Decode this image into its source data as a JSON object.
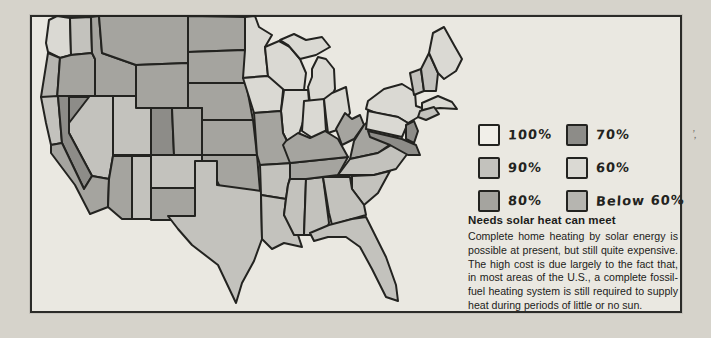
{
  "page": {
    "background": "#d6d3cb",
    "panel_background": "#eae8e1",
    "panel_border": "#2b2b28"
  },
  "legend": {
    "items": [
      {
        "label": "100%",
        "category": "c100",
        "color": "#f1efe9"
      },
      {
        "label": "90%",
        "category": "c90",
        "color": "#c3c2bd"
      },
      {
        "label": "80%",
        "category": "c80",
        "color": "#a5a49f"
      },
      {
        "label": "70%",
        "category": "c70",
        "color": "#8d8c88"
      },
      {
        "label": "60%",
        "category": "c60",
        "color": "#dad9d3"
      },
      {
        "label": "Below 60%",
        "category": "cb60",
        "color": "#b6b5b0"
      }
    ]
  },
  "caption": {
    "title": "Needs solar heat can meet",
    "body": "Complete home heating by solar energy is possible at present, but still quite expensive. The high cost is due largely to the fact that, in most areas of the U.S., a complete fossil-fuel heating system is still required to supply heat during periods of little or no sun."
  },
  "stray_mark": "’,",
  "map": {
    "stroke": "#232320",
    "category_colors": {
      "c100": "#f1efe9",
      "c90": "#c3c2bd",
      "c80": "#a5a49f",
      "c70": "#8d8c88",
      "c60": "#dad9d3",
      "cb60": "#b6b5b0"
    },
    "regions": [
      {
        "id": "washington-west",
        "category": "c60",
        "points": "14,30 17,7 25,3 38,5 39,42 28,45 16,39"
      },
      {
        "id": "washington-east",
        "category": "c90",
        "points": "38,5 59,4 60,40 39,42"
      },
      {
        "id": "oregon-coast",
        "category": "cb60",
        "points": "16,40 28,45 25,86 9,84"
      },
      {
        "id": "oregon-inland",
        "category": "c80",
        "points": "28,45 39,42 60,40 63,46 63,85 25,86"
      },
      {
        "id": "idaho",
        "category": "c80",
        "points": "59,4 67,3 70,40 104,52 104,83 63,83 63,46 60,40"
      },
      {
        "id": "montana",
        "category": "c80",
        "points": "67,3 156,3 156,50 104,52 70,40"
      },
      {
        "id": "wyoming",
        "category": "c80",
        "points": "104,52 156,50 156,95 104,95"
      },
      {
        "id": "north-dakota",
        "category": "c80",
        "points": "156,3 213,4 213,37 156,39"
      },
      {
        "id": "south-dakota",
        "category": "c80",
        "points": "156,39 213,37 214,70 156,70"
      },
      {
        "id": "nebraska",
        "category": "c80",
        "points": "156,70 214,70 221,107 170,107 170,95 156,95"
      },
      {
        "id": "kansas",
        "category": "c80",
        "points": "170,107 221,107 225,142 170,142"
      },
      {
        "id": "utah",
        "category": "c90",
        "points": "81,83 104,83 104,95 119,95 119,142 81,142"
      },
      {
        "id": "colorado-west",
        "category": "c70",
        "points": "119,95 140,95 142,142 119,142"
      },
      {
        "id": "colorado-east",
        "category": "c80",
        "points": "140,95 170,95 170,142 142,142"
      },
      {
        "id": "nevada",
        "category": "c90",
        "points": "37,83 81,83 81,143 77,166 60,163 37,120"
      },
      {
        "id": "nevada-northwest",
        "category": "c70",
        "points": "37,84 57,84 37,110"
      },
      {
        "id": "california-north",
        "category": "c90",
        "points": "9,84 26,83 30,130 19,132 14,110"
      },
      {
        "id": "california-sierra",
        "category": "c70",
        "points": "26,83 37,83 37,120 60,163 52,176 30,130"
      },
      {
        "id": "california-south",
        "category": "c80",
        "points": "19,132 30,130 52,176 60,163 77,166 76,194 58,201 43,172 19,140"
      },
      {
        "id": "arizona-west",
        "category": "c80",
        "points": "81,143 100,143 100,206 90,206 76,194 77,166"
      },
      {
        "id": "arizona-east",
        "category": "c90",
        "points": "100,143 119,143 119,206 100,206"
      },
      {
        "id": "new-mexico-north",
        "category": "c90",
        "points": "119,142 170,142 170,175 119,175"
      },
      {
        "id": "new-mexico-south",
        "category": "c80",
        "points": "119,175 170,175 170,207 119,207"
      },
      {
        "id": "oklahoma",
        "category": "c80",
        "points": "170,142 225,142 228,178 190,178 185,168 185,151 170,151"
      },
      {
        "id": "texas",
        "category": "c90",
        "points": "163,148 185,148 185,172 229,178 230,226 222,248 210,270 204,290 186,252 160,232 146,216 136,203 163,203"
      },
      {
        "id": "minnesota",
        "category": "c60",
        "points": "213,4 223,3 227,14 240,22 233,34 236,63 211,65 213,37"
      },
      {
        "id": "iowa",
        "category": "c60",
        "points": "211,65 236,63 252,68 249,98 222,100"
      },
      {
        "id": "wisconsin",
        "category": "c60",
        "points": "233,34 247,28 258,34 268,46 274,60 272,77 252,77 236,63"
      },
      {
        "id": "michigan-upper",
        "category": "c60",
        "points": "248,27 262,21 274,27 290,24 298,34 284,42 268,46 256,32"
      },
      {
        "id": "michigan-lower",
        "category": "c60",
        "points": "280,56 286,44 294,46 302,56 303,76 297,90 278,90 276,74 280,64"
      },
      {
        "id": "illinois",
        "category": "c60",
        "points": "252,77 276,77 277,88 270,112 266,124 258,134 251,120 249,98"
      },
      {
        "id": "indiana",
        "category": "c60",
        "points": "272,88 292,86 294,118 282,126 270,118"
      },
      {
        "id": "ohio",
        "category": "c60",
        "points": "292,86 300,80 314,74 318,100 308,116 296,120 294,104"
      },
      {
        "id": "missouri",
        "category": "c80",
        "points": "222,100 249,98 251,120 258,134 262,150 228,152 225,142"
      },
      {
        "id": "arkansas",
        "category": "c90",
        "points": "228,152 262,150 256,172 254,186 229,182"
      },
      {
        "id": "louisiana",
        "category": "c90",
        "points": "229,182 254,186 252,202 264,216 270,234 252,230 240,236 230,226"
      },
      {
        "id": "mississippi",
        "category": "c90",
        "points": "258,166 274,166 272,222 262,222 252,202 254,186 256,172"
      },
      {
        "id": "alabama",
        "category": "c90",
        "points": "274,166 291,164 297,210 292,224 280,222 272,222"
      },
      {
        "id": "tennessee",
        "category": "c80",
        "points": "258,150 316,144 306,162 274,166 258,166"
      },
      {
        "id": "kentucky",
        "category": "c80",
        "points": "254,128 266,120 278,125 293,118 306,126 316,144 258,150 251,132"
      },
      {
        "id": "west-virginia",
        "category": "c80",
        "points": "304,116 313,100 320,106 328,102 332,112 322,126 310,132"
      },
      {
        "id": "virginia",
        "category": "c80",
        "points": "332,112 342,104 358,118 366,126 346,140 318,146 322,128"
      },
      {
        "id": "north-carolina",
        "category": "c90",
        "points": "318,146 346,140 366,128 376,140 364,156 342,162 306,162"
      },
      {
        "id": "south-carolina",
        "category": "c90",
        "points": "320,163 342,162 358,158 346,180 332,192 320,176"
      },
      {
        "id": "georgia",
        "category": "c90",
        "points": "291,164 318,164 320,176 332,192 334,202 320,206 300,212 297,200"
      },
      {
        "id": "florida",
        "category": "c90",
        "points": "278,220 297,212 320,206 334,204 340,216 354,244 364,272 366,288 354,284 340,256 328,234 314,224 296,224 282,228"
      },
      {
        "id": "new-york",
        "category": "c60",
        "points": "336,88 352,76 370,71 383,79 384,93 396,97 388,103 376,110 366,104 344,100 334,96"
      },
      {
        "id": "pennsylvania",
        "category": "c60",
        "points": "336,98 366,104 376,110 370,124 334,116"
      },
      {
        "id": "new-jersey",
        "category": "c70",
        "points": "374,112 382,108 386,118 382,130 374,126"
      },
      {
        "id": "maryland-delaware",
        "category": "c70",
        "points": "336,118 370,126 384,132 388,142 376,142 358,132 338,124"
      },
      {
        "id": "vermont",
        "category": "c90",
        "points": "378,60 389,56 392,78 382,82"
      },
      {
        "id": "new-hampshire",
        "category": "c90",
        "points": "389,56 397,40 406,60 404,78 392,78"
      },
      {
        "id": "maine",
        "category": "c60",
        "points": "397,40 401,20 412,14 422,32 430,46 424,58 412,66 406,60"
      },
      {
        "id": "massachusetts",
        "category": "c60",
        "points": "390,90 406,83 420,89 425,96 408,95 390,97"
      },
      {
        "id": "connecticut-ri",
        "category": "c90",
        "points": "388,98 402,94 407,101 394,107 386,104"
      }
    ]
  }
}
